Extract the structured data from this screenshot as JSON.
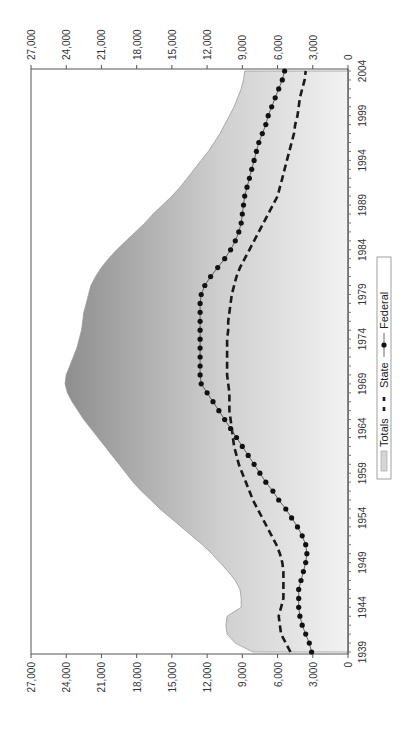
{
  "chart_data": {
    "type": "area",
    "orientation": "rotated-90-ccw",
    "title": "",
    "xlabel": "",
    "ylabel": "",
    "x": [
      1939,
      1940,
      1941,
      1942,
      1943,
      1944,
      1945,
      1946,
      1947,
      1948,
      1949,
      1950,
      1951,
      1952,
      1953,
      1954,
      1955,
      1956,
      1957,
      1958,
      1959,
      1960,
      1961,
      1962,
      1963,
      1964,
      1965,
      1966,
      1967,
      1968,
      1969,
      1970,
      1971,
      1972,
      1973,
      1974,
      1975,
      1976,
      1977,
      1978,
      1979,
      1980,
      1981,
      1982,
      1983,
      1984,
      1985,
      1986,
      1987,
      1988,
      1989,
      1990,
      1991,
      1992,
      1993,
      1994,
      1995,
      1996,
      1997,
      1998,
      1999,
      2000,
      2001,
      2002,
      2003,
      2004
    ],
    "series": [
      {
        "name": "Totals",
        "style": "area-gradient",
        "values": [
          8100,
          9600,
          10300,
          10400,
          10300,
          9100,
          9100,
          9200,
          9600,
          10200,
          10900,
          11600,
          12400,
          13300,
          14200,
          15100,
          16000,
          16800,
          17600,
          18300,
          18900,
          19500,
          20100,
          20700,
          21300,
          21900,
          22500,
          23000,
          23500,
          23900,
          24100,
          24000,
          23700,
          23400,
          23100,
          22900,
          22700,
          22600,
          22500,
          22300,
          22100,
          21900,
          21500,
          21000,
          20400,
          19700,
          18900,
          18100,
          17300,
          16600,
          15800,
          15000,
          14300,
          13700,
          13100,
          12500,
          11900,
          11400,
          10900,
          10500,
          10100,
          9700,
          9400,
          9100,
          8900,
          8800
        ]
      },
      {
        "name": "State",
        "style": "dashed",
        "values": [
          4900,
          5300,
          5700,
          5800,
          5900,
          5700,
          5500,
          5500,
          5500,
          5500,
          5600,
          5800,
          6100,
          6500,
          6900,
          7300,
          7700,
          8100,
          8400,
          8700,
          9000,
          9300,
          9500,
          9700,
          9800,
          9900,
          10000,
          10100,
          10100,
          10100,
          10200,
          10300,
          10300,
          10300,
          10300,
          10300,
          10200,
          10200,
          10100,
          10000,
          9900,
          9700,
          9500,
          9200,
          8800,
          8400,
          8000,
          7600,
          7200,
          6800,
          6400,
          6000,
          5800,
          5600,
          5400,
          5200,
          5000,
          4800,
          4600,
          4500,
          4300,
          4200,
          4100,
          3900,
          3700,
          3600
        ]
      },
      {
        "name": "Federal",
        "style": "dotted-circle",
        "values": [
          3100,
          3300,
          3600,
          3900,
          4100,
          4200,
          4200,
          4200,
          4000,
          3800,
          3600,
          3500,
          3600,
          3900,
          4300,
          4800,
          5300,
          5900,
          6400,
          7000,
          7500,
          8000,
          8500,
          9000,
          9500,
          10000,
          10500,
          11000,
          11500,
          12000,
          12500,
          12600,
          12600,
          12600,
          12600,
          12600,
          12600,
          12600,
          12600,
          12600,
          12500,
          12200,
          11700,
          11100,
          10500,
          10000,
          9600,
          9300,
          9100,
          9000,
          8900,
          8800,
          8600,
          8400,
          8200,
          8000,
          7800,
          7600,
          7300,
          7000,
          6800,
          6500,
          6200,
          5900,
          5600,
          5400
        ]
      }
    ],
    "value_axis": {
      "min": 0,
      "max": 27000,
      "step": 3000,
      "tick_labels": [
        "0",
        "3,000",
        "6,000",
        "9,000",
        "12,000",
        "15,000",
        "18,000",
        "21,000",
        "24,000",
        "27,000"
      ],
      "mirrored": true
    },
    "year_axis": {
      "min": 1939,
      "max": 2004,
      "tick_labels": [
        "1939",
        "1944",
        "1949",
        "1954",
        "1959",
        "1964",
        "1969",
        "1974",
        "1979",
        "1984",
        "1989",
        "1994",
        "1999",
        "2004"
      ]
    },
    "legend": {
      "entries": [
        "Totals",
        "State",
        "Federal"
      ],
      "position": "bottom-center (rotated)"
    },
    "grid": false
  },
  "colors": {
    "area_dark": "#9a9a9a",
    "area_light": "#ececec",
    "line": "#1a1a1a",
    "axis": "#555555"
  }
}
